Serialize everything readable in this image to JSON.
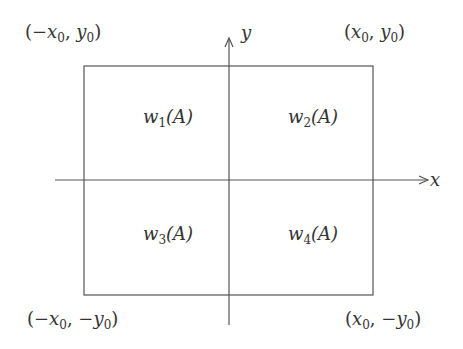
{
  "diagram": {
    "corners": {
      "top_left": {
        "prefix": "(−",
        "x": "x",
        "xsub": "0",
        "sep": ", ",
        "ysign": "",
        "y": "y",
        "ysub": "0",
        "suffix": ")"
      },
      "top_right": {
        "prefix": "(",
        "x": "x",
        "xsub": "0",
        "sep": ", ",
        "ysign": "",
        "y": "y",
        "ysub": "0",
        "suffix": ")"
      },
      "bottom_left": {
        "prefix": "(−",
        "x": "x",
        "xsub": "0",
        "sep": ", ",
        "ysign": "−",
        "y": "y",
        "ysub": "0",
        "suffix": ")"
      },
      "bottom_right": {
        "prefix": "(",
        "x": "x",
        "xsub": "0",
        "sep": ", ",
        "ysign": "−",
        "y": "y",
        "ysub": "0",
        "suffix": ")"
      }
    },
    "axes": {
      "x_label": "x",
      "y_label": "y"
    },
    "regions": [
      {
        "w": "w",
        "sub": "1",
        "arg": "(A)"
      },
      {
        "w": "w",
        "sub": "2",
        "arg": "(A)"
      },
      {
        "w": "w",
        "sub": "3",
        "arg": "(A)"
      },
      {
        "w": "w",
        "sub": "4",
        "arg": "(A)"
      }
    ],
    "colors": {
      "line": "#555555",
      "text": "#333333"
    }
  }
}
